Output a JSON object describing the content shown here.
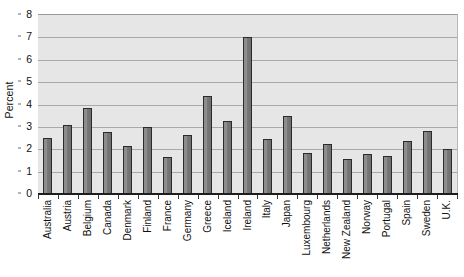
{
  "chart_data": {
    "type": "bar",
    "title": "",
    "xlabel": "",
    "ylabel": "Percent",
    "ylim": [
      0,
      8
    ],
    "yticks": [
      0,
      1,
      2,
      3,
      4,
      5,
      6,
      7,
      8
    ],
    "grid": true,
    "legend": false,
    "categories": [
      "Australia",
      "Austria",
      "Belgium",
      "Canada",
      "Denmark",
      "Finland",
      "France",
      "Germany",
      "Greece",
      "Iceland",
      "Ireland",
      "Italy",
      "Japan",
      "Luxembourg",
      "Netherlands",
      "New Zealand",
      "Norway",
      "Portugal",
      "Spain",
      "Sweden",
      "U.K."
    ],
    "values": [
      2.5,
      3.1,
      3.85,
      2.75,
      2.15,
      3.0,
      1.65,
      2.65,
      4.4,
      3.25,
      7.0,
      2.45,
      3.5,
      1.85,
      2.25,
      1.55,
      1.8,
      1.7,
      2.35,
      2.8,
      2.0
    ],
    "colors": {
      "bar_fill": "#828282",
      "bar_border": "#2b2b2b",
      "plot_background": "#e6e6e6",
      "gridline": "#a9a9a9",
      "axis": "#1d1d1d",
      "text": "#111111",
      "page_background": "#ffffff"
    }
  }
}
